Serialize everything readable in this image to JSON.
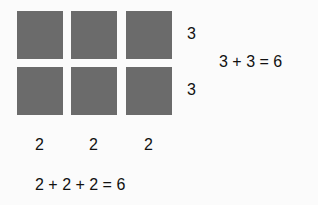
{
  "diagram": {
    "grid": {
      "rows": 2,
      "columns": 3,
      "square_color": "#6b6b6b"
    },
    "row_labels": [
      "3",
      "3"
    ],
    "column_labels": [
      "2",
      "2",
      "2"
    ],
    "row_equation": "3 + 3 = 6",
    "column_equation": "2 + 2 + 2 = 6"
  }
}
